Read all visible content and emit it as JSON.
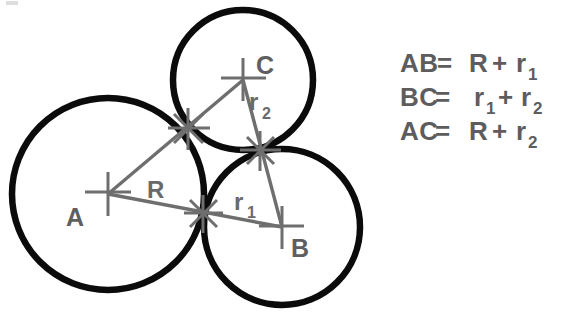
{
  "figure": {
    "background_color": "#ffffff",
    "circle_color": "#0b0b0b",
    "annotation_color": "#6e6e6e",
    "text_color": "#5d5d5d",
    "circles": [
      {
        "id": "A",
        "label": "A",
        "cx": 108,
        "cy": 194,
        "r": 96,
        "radius_symbol": "R"
      },
      {
        "id": "B",
        "label": "B",
        "cx": 282,
        "cy": 227,
        "r": 78,
        "radius_symbol": "r",
        "radius_subscript": "1"
      },
      {
        "id": "C",
        "label": "C",
        "cx": 243,
        "cy": 80,
        "r": 70,
        "radius_symbol": "r",
        "radius_subscript": "2"
      }
    ],
    "center_labels": {
      "a": "A",
      "b": "B",
      "c": "C"
    },
    "segment_labels": {
      "r_big": "R",
      "r_one_base": "r",
      "r_one_sub": "1",
      "r_two_base": "r",
      "r_two_sub": "2"
    },
    "tangent_points": [
      {
        "between": "A-C",
        "x": 188,
        "y": 128
      },
      {
        "between": "A-B",
        "x": 203,
        "y": 213
      },
      {
        "between": "B-C",
        "x": 260,
        "y": 150
      }
    ]
  },
  "equations": [
    {
      "id": "eq-ab",
      "left": "AB",
      "operator": "=",
      "term1": "R",
      "plus": "+",
      "term2_base": "r",
      "term2_sub": "1",
      "full": "AB = R + r1"
    },
    {
      "id": "eq-bc",
      "left": "BC",
      "operator": "=",
      "term1_base": "r",
      "term1_sub": "1",
      "plus": "+",
      "term2_base": "r",
      "term2_sub": "2",
      "full": "BC = r1 + r2"
    },
    {
      "id": "eq-ac",
      "left": "AC",
      "operator": "=",
      "term1": "R",
      "plus": "+",
      "term2_base": "r",
      "term2_sub": "2",
      "full": "AC = R + r2"
    }
  ]
}
